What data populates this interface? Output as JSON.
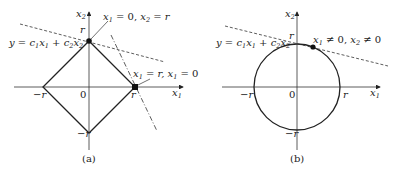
{
  "figure": {
    "panels": [
      {
        "id": "a",
        "caption": "(a)",
        "shape": "diamond (L1 ball)",
        "axis_labels": {
          "x": "x",
          "x_sub": "1",
          "y": "x",
          "y_sub": "2"
        },
        "ticks": {
          "top": "r",
          "right": "r",
          "left": "−r",
          "bottom": "−r",
          "origin": "0"
        },
        "line_label": {
          "prefix": "y = c",
          "full": "y = c₁x₁ + c₂x₂"
        },
        "annotations": [
          {
            "text": "x₁ = 0,   x₂ = r",
            "parts": [
              "x",
              "1",
              " = 0,  x",
              "2",
              " = r"
            ]
          },
          {
            "text": "x₁ = r,   x₁ = 0",
            "parts": [
              "x",
              "1",
              " = r,  x",
              "1",
              " = 0"
            ]
          }
        ]
      },
      {
        "id": "b",
        "caption": "(b)",
        "shape": "circle (L2 ball)",
        "axis_labels": {
          "x": "x",
          "x_sub": "1",
          "y": "x",
          "y_sub": "2"
        },
        "ticks": {
          "top": "r",
          "right": "r",
          "left": "−r",
          "bottom": "−r",
          "origin": "0"
        },
        "line_label": {
          "full": "y = c₁x₁ + c₂x₂"
        },
        "annotations": [
          {
            "text": "x₁ ≠ 0,   x₂ ≠ 0",
            "parts": [
              "x",
              "1",
              " ≠ 0,  x",
              "2",
              " ≠ 0"
            ]
          }
        ]
      }
    ]
  }
}
